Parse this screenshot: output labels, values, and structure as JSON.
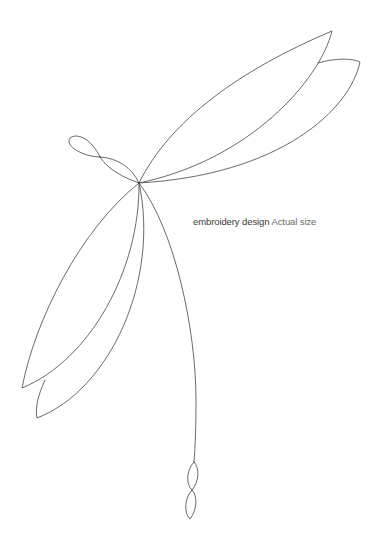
{
  "caption": {
    "title": "embroidery design",
    "subtitle": "Actual size"
  },
  "drawing": {
    "subject": "dragonfly line art",
    "stroke_color": "#444444",
    "background": "#ffffff"
  }
}
